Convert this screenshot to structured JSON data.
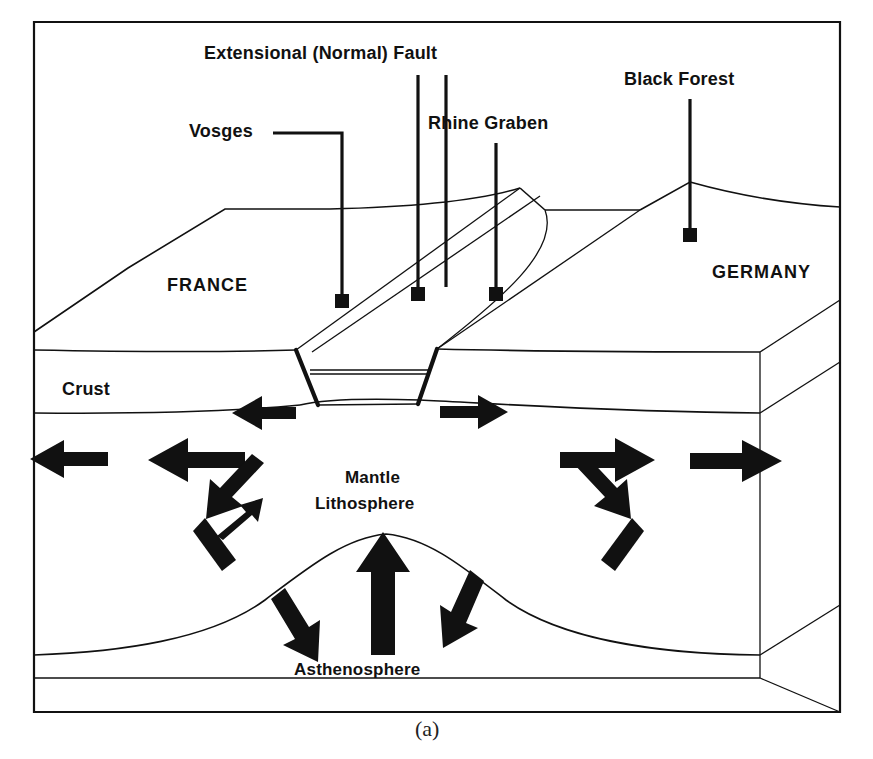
{
  "figure": {
    "caption": "(a)",
    "type": "geological-block-diagram",
    "background_color": "#ffffff",
    "line_color": "#111111",
    "arrow_color": "#111111"
  },
  "labels": {
    "extensional_fault": "Extensional (Normal) Fault",
    "black_forest": "Black Forest",
    "vosges": "Vosges",
    "rhine_graben": "Rhine Graben",
    "france": "FRANCE",
    "germany": "GERMANY",
    "crust": "Crust",
    "mantle_line1": "Mantle",
    "mantle_line2": "Lithosphere",
    "asthenosphere": "Asthenosphere"
  },
  "leaders": [
    {
      "name": "extensional-fault-leader",
      "label": "Extensional (Normal) Fault",
      "style": "vertical-with-square-terminator"
    },
    {
      "name": "black-forest-leader",
      "label": "Black Forest",
      "style": "vertical-with-square-terminator"
    },
    {
      "name": "vosges-leader",
      "label": "Vosges",
      "style": "elbow-horizontal-then-vertical-with-square-terminator"
    },
    {
      "name": "rhine-graben-leader",
      "label": "Rhine Graben",
      "style": "vertical-with-square-terminator"
    },
    {
      "name": "fault-plane-leader",
      "label": "Extensional (Normal) Fault",
      "style": "vertical-with-square-terminator"
    }
  ],
  "layers": [
    {
      "name": "crust",
      "label": "Crust"
    },
    {
      "name": "mantle-lithosphere",
      "label": "Mantle Lithosphere"
    },
    {
      "name": "asthenosphere",
      "label": "Asthenosphere"
    }
  ],
  "arrows": [
    {
      "name": "crust-extension-left",
      "direction": "left",
      "zone": "crust"
    },
    {
      "name": "crust-extension-right",
      "direction": "right",
      "zone": "crust"
    },
    {
      "name": "mantle-flow-left-outer",
      "direction": "left",
      "zone": "mantle-lithosphere"
    },
    {
      "name": "mantle-flow-left-inner",
      "direction": "left",
      "zone": "mantle-lithosphere"
    },
    {
      "name": "mantle-flow-right-inner",
      "direction": "right",
      "zone": "mantle-lithosphere"
    },
    {
      "name": "mantle-flow-right-outer",
      "direction": "right",
      "zone": "mantle-lithosphere"
    },
    {
      "name": "upwelling-diagonal-left",
      "direction": "up-left",
      "zone": "mantle-lithosphere"
    },
    {
      "name": "upwelling-diagonal-right",
      "direction": "up-right",
      "zone": "mantle-lithosphere"
    },
    {
      "name": "asthenosphere-rise-left",
      "direction": "up-right",
      "zone": "asthenosphere"
    },
    {
      "name": "asthenosphere-rise-center",
      "direction": "up",
      "zone": "asthenosphere"
    },
    {
      "name": "asthenosphere-rise-right",
      "direction": "up-left",
      "zone": "asthenosphere"
    }
  ]
}
